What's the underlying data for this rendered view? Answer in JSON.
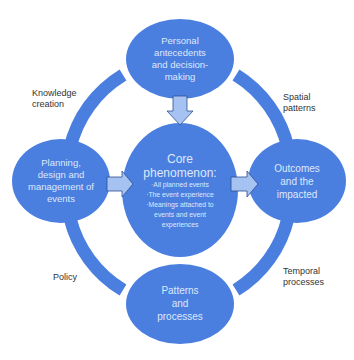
{
  "colors": {
    "node_fill": "#4a7fe0",
    "ring_fill": "#4a7fe0",
    "arrow_fill": "#a6c2f2",
    "arrow_stroke": "#2f4f8f",
    "node_text": "#dfe8fb",
    "label_text": "#333333",
    "background": "#ffffff"
  },
  "nodes": {
    "top": {
      "lines": [
        "Personal",
        "antecedents",
        "and decision-",
        "making"
      ]
    },
    "left": {
      "lines": [
        "Planning,",
        "design and",
        "management of",
        "events"
      ]
    },
    "center": {
      "title_lines": [
        "Core",
        "phenomenon:"
      ],
      "bullets": [
        "·All planned events",
        "·The event experience",
        "·Meanings attached to",
        "events and event",
        "experiences"
      ]
    },
    "right": {
      "lines": [
        "Outcomes",
        "and the",
        "impacted"
      ]
    },
    "bottom": {
      "lines": [
        "Patterns",
        "and",
        "processes"
      ]
    }
  },
  "ring_labels": {
    "top_left": [
      "Knowledge",
      "creation"
    ],
    "top_right": [
      "Spatial",
      "patterns"
    ],
    "bottom_left": [
      "Policy"
    ],
    "bottom_right": [
      "Temporal",
      "processes"
    ]
  },
  "arrows": [
    {
      "from": "top",
      "to": "center",
      "direction": "down"
    },
    {
      "from": "left",
      "to": "center",
      "direction": "right"
    },
    {
      "from": "center",
      "to": "right",
      "direction": "right"
    }
  ]
}
